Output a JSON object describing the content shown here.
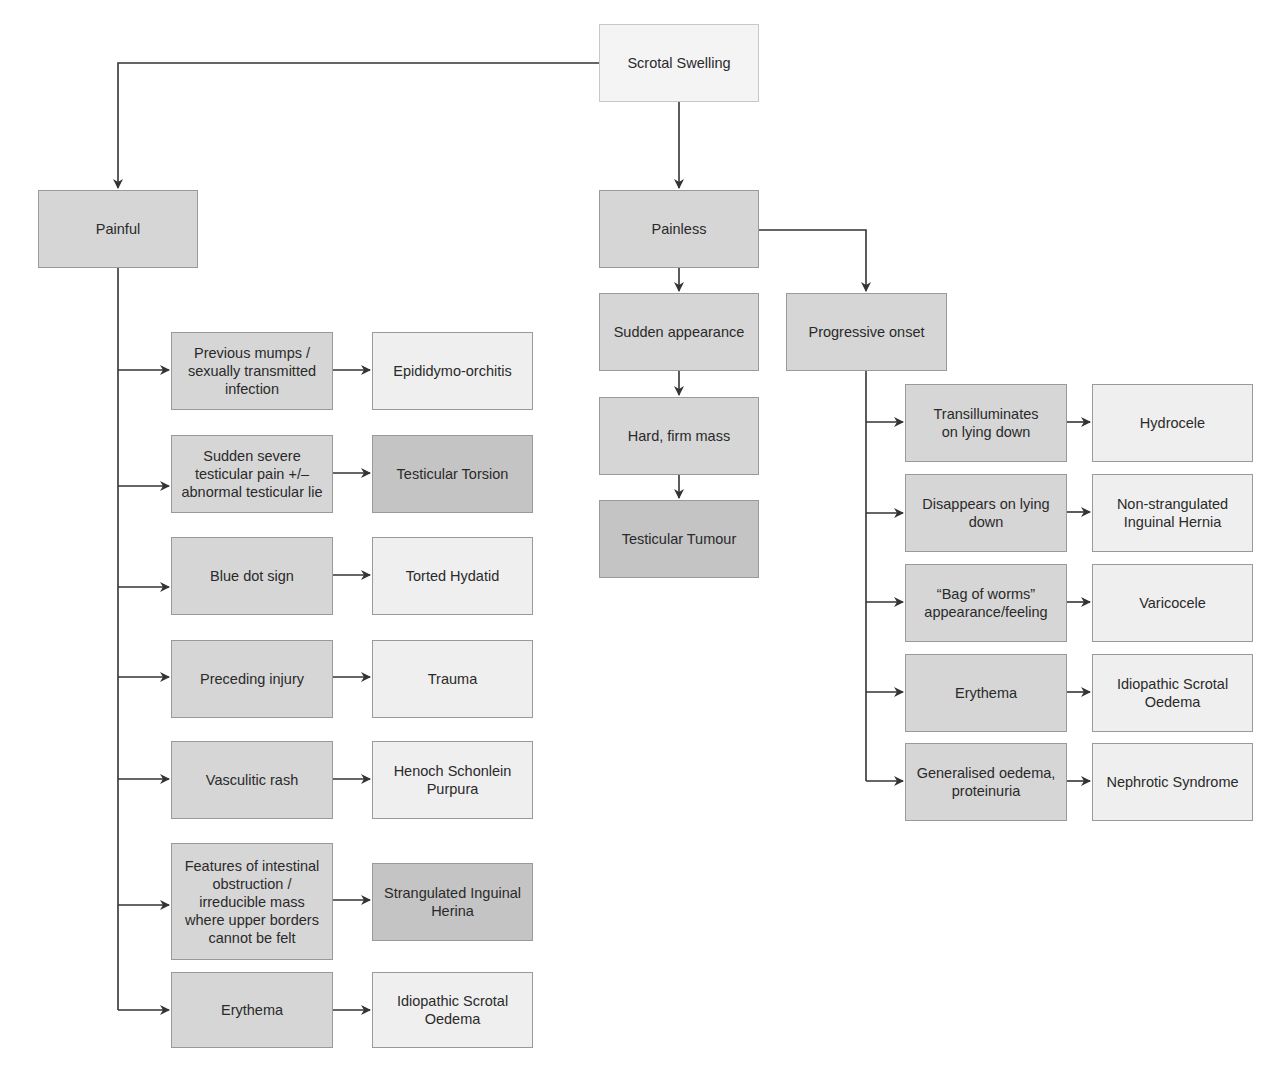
{
  "title": "Scrotal Swelling",
  "colors": {
    "root_fill": "#f4f4f4",
    "criterion_fill": "#d6d6d6",
    "outcome_light_fill": "#efefef",
    "outcome_dark_fill": "#c4c4c4",
    "line": "#333333"
  },
  "root": {
    "label": "Scrotal Swelling"
  },
  "painful": {
    "label": "Painful",
    "branches": [
      {
        "criterion": "Previous mumps /\nsexually transmitted\ninfection",
        "outcome": "Epididymo-orchitis",
        "emphasis": false
      },
      {
        "criterion": "Sudden severe\ntesticular pain +/–\nabnormal testicular lie",
        "outcome": "Testicular Torsion",
        "emphasis": true
      },
      {
        "criterion": "Blue dot sign",
        "outcome": "Torted Hydatid",
        "emphasis": false
      },
      {
        "criterion": "Preceding injury",
        "outcome": "Trauma",
        "emphasis": false
      },
      {
        "criterion": "Vasculitic rash",
        "outcome": "Henoch Schonlein\nPurpura",
        "emphasis": false
      },
      {
        "criterion": "Features of intestinal\nobstruction /\nirreducible mass\nwhere upper borders\ncannot be felt",
        "outcome": "Strangulated Inguinal\nHerina",
        "emphasis": true
      },
      {
        "criterion": "Erythema",
        "outcome": "Idiopathic Scrotal\nOedema",
        "emphasis": false
      }
    ]
  },
  "painless": {
    "label": "Painless",
    "sudden": {
      "label": "Sudden appearance",
      "steps": [
        "Hard, firm mass",
        "Testicular Tumour"
      ]
    },
    "progressive": {
      "label": "Progressive onset",
      "branches": [
        {
          "criterion": "Transilluminates\non lying down",
          "outcome": "Hydrocele"
        },
        {
          "criterion": "Disappears on lying\ndown",
          "outcome": "Non-strangulated\nInguinal Hernia"
        },
        {
          "criterion": "“Bag of worms”\nappearance/feeling",
          "outcome": "Varicocele"
        },
        {
          "criterion": "Erythema",
          "outcome": "Idiopathic Scrotal\nOedema"
        },
        {
          "criterion": "Generalised oedema,\nproteinuria",
          "outcome": "Nephrotic Syndrome"
        }
      ]
    }
  }
}
